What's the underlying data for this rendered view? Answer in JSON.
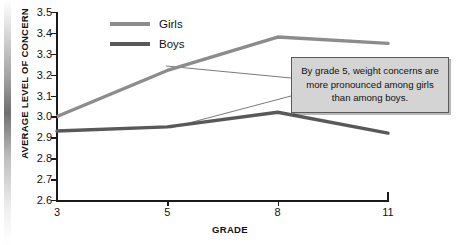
{
  "chart_data": {
    "type": "line",
    "title": "",
    "xlabel": "GRADE",
    "ylabel": "AVERAGE LEVEL OF CONCERN",
    "categories": [
      "3",
      "5",
      "8",
      "11"
    ],
    "series": [
      {
        "name": "Girls",
        "color": "#8c8c8c",
        "values": [
          3.0,
          3.22,
          3.38,
          3.35
        ]
      },
      {
        "name": "Boys",
        "color": "#595959",
        "values": [
          2.93,
          2.95,
          3.02,
          2.92
        ]
      }
    ],
    "ylim": [
      2.6,
      3.5
    ],
    "ytick_step": 0.1,
    "yticks": [
      "3.5",
      "3.4",
      "3.3",
      "3.2",
      "3.1",
      "3.0",
      "2.9",
      "2.8",
      "2.7",
      "2.6"
    ],
    "grid": false,
    "legend_position": "top-left",
    "annotations": [
      {
        "text": "By grade 5, weight concerns are more pronounced among girls than among boys."
      }
    ]
  },
  "legend": {
    "items": [
      {
        "label": "Girls"
      },
      {
        "label": "Boys"
      }
    ]
  },
  "callout": {
    "text": "By grade 5, weight concerns are more pronounced among girls than among boys."
  },
  "axes": {
    "x_title": "GRADE",
    "y_title": "AVERAGE LEVEL OF CONCERN"
  }
}
